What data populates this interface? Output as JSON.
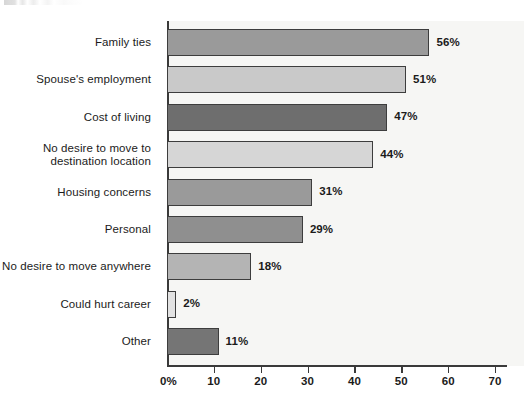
{
  "chart_data": {
    "type": "bar",
    "orientation": "horizontal",
    "title": "",
    "subtitle": "",
    "xlabel": "",
    "ylabel": "",
    "xlim": [
      0,
      70
    ],
    "grid": false,
    "legend": null,
    "categories": [
      "Family ties",
      "Spouse's employment",
      "Cost of living",
      "No desire to move to\ndestination location",
      "Housing concerns",
      "Personal",
      "No desire to move anywhere",
      "Could hurt career",
      "Other"
    ],
    "values": [
      56,
      51,
      47,
      44,
      31,
      29,
      18,
      2,
      11
    ],
    "data_labels": [
      "56%",
      "51%",
      "47%",
      "44%",
      "31%",
      "29%",
      "18%",
      "2%",
      "11%"
    ],
    "bar_colors": [
      "#9a9a9a",
      "#c9c9c9",
      "#6e6e6e",
      "#d6d6d6",
      "#9a9a9a",
      "#8f8f8f",
      "#b4b4b4",
      "#e2e2e2",
      "#757575"
    ],
    "xticks": [
      0,
      10,
      20,
      30,
      40,
      50,
      60,
      70
    ],
    "xtick_labels": [
      "0%",
      "10",
      "20",
      "30",
      "40",
      "50",
      "60",
      "70"
    ],
    "plot_background": "#f6f6f4",
    "axis_color": "#3a3a3a",
    "bar_edge_color": "#3d3d3d"
  }
}
